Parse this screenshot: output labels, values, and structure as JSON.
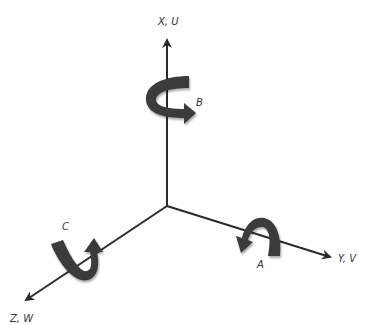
{
  "diagram": {
    "type": "coordinate-axes-rotation",
    "axes": [
      {
        "id": "x",
        "label": "X, U",
        "direction": "up"
      },
      {
        "id": "y",
        "label": "Y, V",
        "direction": "lower-right"
      },
      {
        "id": "z",
        "label": "Z, W",
        "direction": "lower-left"
      }
    ],
    "rotations": [
      {
        "id": "A",
        "label": "A",
        "about_axis": "Y, V"
      },
      {
        "id": "B",
        "label": "B",
        "about_axis": "X, U"
      },
      {
        "id": "C",
        "label": "C",
        "about_axis": "Z, W"
      }
    ],
    "colors": {
      "axis": "#2a2a2a",
      "arrow": "#3a3a3a",
      "text": "#333333"
    }
  }
}
